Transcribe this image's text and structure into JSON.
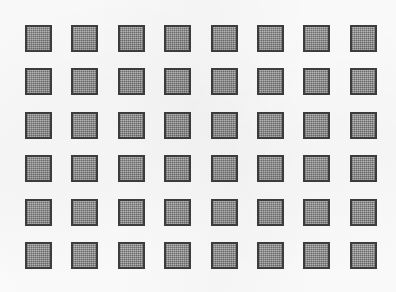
{
  "image": {
    "title": "Grid of shaded squares",
    "description": "Scanned monochrome figure showing a regular rectangular array of uniformly shaded squares",
    "width": 396,
    "height": 292
  },
  "colors": {
    "background": "#fdfdfd",
    "square_fill": "#9a9a9a",
    "square_border": "#3e3e3e"
  },
  "grid": {
    "columns": 8,
    "rows": 6,
    "total_cells": 48,
    "cell_size_px": 27,
    "column_pitch_px": 46,
    "row_pitch_px": 43,
    "origin_x_px": 25,
    "origin_y_px": 25,
    "cells": [
      {
        "id": "r1c1",
        "row": 1,
        "col": 1,
        "state": "filled"
      },
      {
        "id": "r1c2",
        "row": 1,
        "col": 2,
        "state": "filled"
      },
      {
        "id": "r1c3",
        "row": 1,
        "col": 3,
        "state": "filled"
      },
      {
        "id": "r1c4",
        "row": 1,
        "col": 4,
        "state": "filled"
      },
      {
        "id": "r1c5",
        "row": 1,
        "col": 5,
        "state": "filled"
      },
      {
        "id": "r1c6",
        "row": 1,
        "col": 6,
        "state": "filled"
      },
      {
        "id": "r1c7",
        "row": 1,
        "col": 7,
        "state": "filled"
      },
      {
        "id": "r1c8",
        "row": 1,
        "col": 8,
        "state": "filled"
      },
      {
        "id": "r2c1",
        "row": 2,
        "col": 1,
        "state": "filled"
      },
      {
        "id": "r2c2",
        "row": 2,
        "col": 2,
        "state": "filled"
      },
      {
        "id": "r2c3",
        "row": 2,
        "col": 3,
        "state": "filled"
      },
      {
        "id": "r2c4",
        "row": 2,
        "col": 4,
        "state": "filled"
      },
      {
        "id": "r2c5",
        "row": 2,
        "col": 5,
        "state": "filled"
      },
      {
        "id": "r2c6",
        "row": 2,
        "col": 6,
        "state": "filled"
      },
      {
        "id": "r2c7",
        "row": 2,
        "col": 7,
        "state": "filled"
      },
      {
        "id": "r2c8",
        "row": 2,
        "col": 8,
        "state": "filled"
      },
      {
        "id": "r3c1",
        "row": 3,
        "col": 1,
        "state": "filled"
      },
      {
        "id": "r3c2",
        "row": 3,
        "col": 2,
        "state": "filled"
      },
      {
        "id": "r3c3",
        "row": 3,
        "col": 3,
        "state": "filled"
      },
      {
        "id": "r3c4",
        "row": 3,
        "col": 4,
        "state": "filled"
      },
      {
        "id": "r3c5",
        "row": 3,
        "col": 5,
        "state": "filled"
      },
      {
        "id": "r3c6",
        "row": 3,
        "col": 6,
        "state": "filled"
      },
      {
        "id": "r3c7",
        "row": 3,
        "col": 7,
        "state": "filled"
      },
      {
        "id": "r3c8",
        "row": 3,
        "col": 8,
        "state": "filled"
      },
      {
        "id": "r4c1",
        "row": 4,
        "col": 1,
        "state": "filled"
      },
      {
        "id": "r4c2",
        "row": 4,
        "col": 2,
        "state": "filled"
      },
      {
        "id": "r4c3",
        "row": 4,
        "col": 3,
        "state": "filled"
      },
      {
        "id": "r4c4",
        "row": 4,
        "col": 4,
        "state": "filled"
      },
      {
        "id": "r4c5",
        "row": 4,
        "col": 5,
        "state": "filled"
      },
      {
        "id": "r4c6",
        "row": 4,
        "col": 6,
        "state": "filled"
      },
      {
        "id": "r4c7",
        "row": 4,
        "col": 7,
        "state": "filled"
      },
      {
        "id": "r4c8",
        "row": 4,
        "col": 8,
        "state": "filled"
      },
      {
        "id": "r5c1",
        "row": 5,
        "col": 1,
        "state": "filled"
      },
      {
        "id": "r5c2",
        "row": 5,
        "col": 2,
        "state": "filled"
      },
      {
        "id": "r5c3",
        "row": 5,
        "col": 3,
        "state": "filled"
      },
      {
        "id": "r5c4",
        "row": 5,
        "col": 4,
        "state": "filled"
      },
      {
        "id": "r5c5",
        "row": 5,
        "col": 5,
        "state": "filled"
      },
      {
        "id": "r5c6",
        "row": 5,
        "col": 6,
        "state": "filled"
      },
      {
        "id": "r5c7",
        "row": 5,
        "col": 7,
        "state": "filled"
      },
      {
        "id": "r5c8",
        "row": 5,
        "col": 8,
        "state": "filled"
      },
      {
        "id": "r6c1",
        "row": 6,
        "col": 1,
        "state": "filled"
      },
      {
        "id": "r6c2",
        "row": 6,
        "col": 2,
        "state": "filled"
      },
      {
        "id": "r6c3",
        "row": 6,
        "col": 3,
        "state": "filled"
      },
      {
        "id": "r6c4",
        "row": 6,
        "col": 4,
        "state": "filled"
      },
      {
        "id": "r6c5",
        "row": 6,
        "col": 5,
        "state": "filled"
      },
      {
        "id": "r6c6",
        "row": 6,
        "col": 6,
        "state": "filled"
      },
      {
        "id": "r6c7",
        "row": 6,
        "col": 7,
        "state": "filled"
      },
      {
        "id": "r6c8",
        "row": 6,
        "col": 8,
        "state": "filled"
      }
    ]
  }
}
